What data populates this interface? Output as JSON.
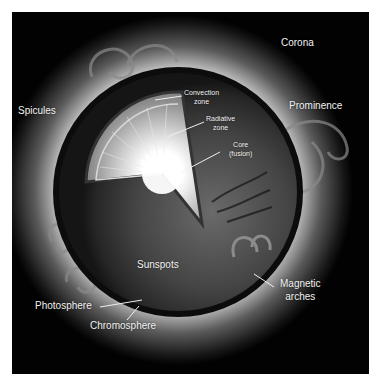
{
  "diagram": {
    "colors": {
      "background": "#ffffff",
      "space": "#020202",
      "corona_glow": "#d8d8d8",
      "sphere_surface": "#3a3a3a",
      "core": "#ffffff",
      "label_text": "#f2f2f2",
      "leader_line": "#f0f0f0"
    },
    "labels": {
      "corona": "Corona",
      "spicules": "Spicules",
      "prominence": "Prominence",
      "convection_zone_line1": "Convection",
      "convection_zone_line2": "zone",
      "radiative_zone_line1": "Radiative",
      "radiative_zone_line2": "zone",
      "core_line1": "Core",
      "core_line2": "(fusion)",
      "sunspots": "Sunspots",
      "magnetic_arches_line1": "Magnetic",
      "magnetic_arches_line2": "arches",
      "photosphere": "Photosphere",
      "chromosphere": "Chromosphere"
    }
  }
}
